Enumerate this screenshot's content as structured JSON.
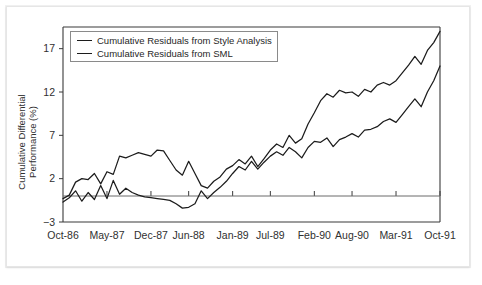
{
  "chart_data": {
    "type": "line",
    "title": "",
    "xlabel": "",
    "ylabel": "Cumulative Differential Performance (%)",
    "ylabel_line1": "Cumulative Differential",
    "ylabel_line2": "Performance (%)",
    "ylim": [
      -3,
      19.5
    ],
    "yticks": [
      -3,
      2,
      7,
      12,
      17
    ],
    "ytick_labels": [
      "−3",
      "2",
      "7",
      "12",
      "17"
    ],
    "grid": false,
    "zero_line": 0,
    "legend_position": "top-left",
    "xtick_labels": [
      "Oct-86",
      "May-87",
      "Dec-87",
      "Jun-88",
      "Jan-89",
      "Jul-89",
      "Feb-90",
      "Aug-90",
      "Mar-91",
      "Oct-91"
    ],
    "x_index_of_ticks": [
      0,
      7,
      14,
      20,
      27,
      33,
      40,
      46,
      53,
      60
    ],
    "series": [
      {
        "name": "Cumulative Residuals from Style Analysis",
        "color": "#1c1c1c",
        "values": [
          -0.3,
          0.1,
          1.6,
          2.0,
          1.9,
          2.6,
          1.4,
          2.8,
          2.5,
          4.6,
          4.4,
          4.7,
          5.0,
          4.8,
          4.6,
          5.3,
          5.2,
          4.1,
          3.0,
          2.4,
          4.0,
          2.6,
          1.2,
          0.9,
          1.7,
          2.2,
          3.1,
          3.5,
          4.2,
          3.7,
          4.6,
          3.4,
          4.3,
          5.3,
          6.0,
          5.6,
          7.0,
          6.1,
          6.6,
          8.3,
          9.6,
          11.0,
          11.8,
          11.4,
          12.2,
          11.9,
          12.0,
          11.5,
          12.3,
          12.0,
          12.8,
          13.1,
          12.8,
          13.3,
          14.2,
          15.1,
          16.1,
          15.2,
          16.8,
          17.7,
          19.0
        ]
      },
      {
        "name": "Cumulative Residuals from SML",
        "color": "#1c1c1c",
        "values": [
          -0.7,
          -0.2,
          0.6,
          -0.6,
          0.4,
          -0.4,
          1.2,
          -0.3,
          1.8,
          0.2,
          0.9,
          0.4,
          0.1,
          -0.1,
          -0.2,
          -0.3,
          -0.4,
          -0.5,
          -0.9,
          -1.4,
          -1.3,
          -0.9,
          0.6,
          -0.3,
          0.4,
          1.0,
          1.7,
          2.6,
          3.4,
          3.0,
          4.0,
          3.1,
          3.9,
          4.6,
          5.1,
          4.7,
          5.6,
          5.1,
          4.4,
          5.6,
          6.3,
          6.2,
          6.7,
          5.7,
          6.5,
          6.8,
          7.2,
          6.8,
          7.6,
          7.7,
          8.0,
          8.6,
          8.9,
          8.5,
          9.4,
          10.3,
          11.2,
          10.3,
          12.0,
          13.3,
          15.0
        ]
      }
    ]
  }
}
